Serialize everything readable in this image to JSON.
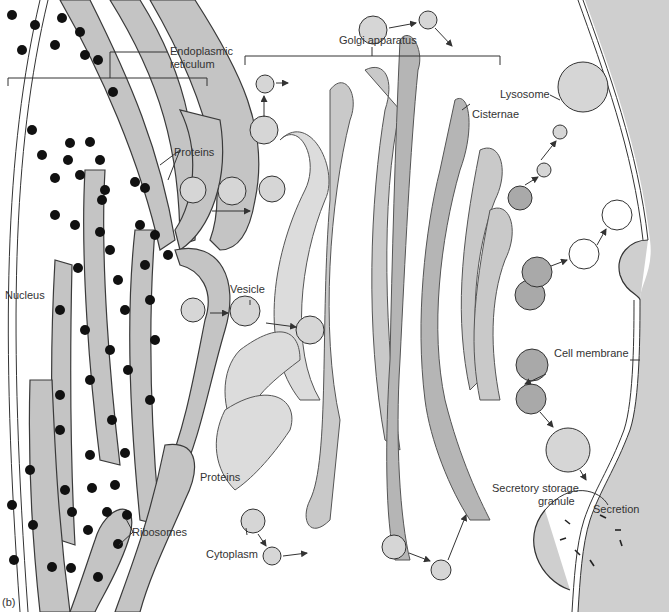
{
  "figure": {
    "panel_label": "(b)"
  },
  "labels": {
    "endoplasmic_reticulum_line1": "Endoplasmic",
    "endoplasmic_reticulum_line2": "reticulum",
    "golgi_apparatus": "Golgi apparatus",
    "cisternae": "Cisternae",
    "lysosome": "Lysosome",
    "proteins_top": "Proteins",
    "nucleus": "Nucleus",
    "vesicle": "Vesicle",
    "cell_membrane": "Cell membrane",
    "proteins_bottom": "Proteins",
    "ribosomes": "Ribosomes",
    "cytoplasm": "Cytoplasm",
    "secretory_line1": "Secretory storage",
    "secretory_line2": "granule",
    "secretion": "Secretion"
  },
  "colors": {
    "background": "#ffffff",
    "extracellular": "#cfcfcf",
    "er_fill": "#c4c4c4",
    "cisterna_light": "#dcdcdc",
    "cisterna_mid": "#c9c9c9",
    "cisterna_dark": "#b5b5b5",
    "ribosome": "#111111",
    "text": "#333333"
  }
}
